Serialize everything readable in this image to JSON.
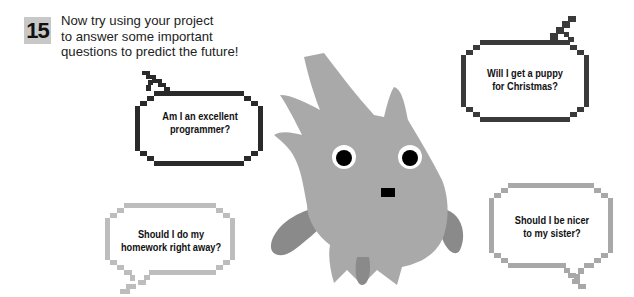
{
  "step": {
    "number": "15",
    "lines": [
      "Now try using your project",
      "to answer some important",
      "questions to predict the future!"
    ]
  },
  "bubbles": [
    {
      "id": "excellent",
      "lines": [
        "Am I an excellent",
        "programmer?"
      ],
      "color": "#2a2a2a"
    },
    {
      "id": "puppy",
      "lines": [
        "Will I get a puppy",
        "for Christmas?"
      ],
      "color": "#3a3a3a"
    },
    {
      "id": "homework",
      "lines": [
        "Should I do my",
        "homework right away?"
      ],
      "color": "#bdbdbd"
    },
    {
      "id": "sister",
      "lines": [
        "Should I be nicer",
        "to my sister?"
      ],
      "color": "#a8a8a8"
    }
  ],
  "creature": {
    "body_color": "#a9a9a9",
    "arm_color": "#8a8a8a",
    "eye_color": "#000000"
  }
}
